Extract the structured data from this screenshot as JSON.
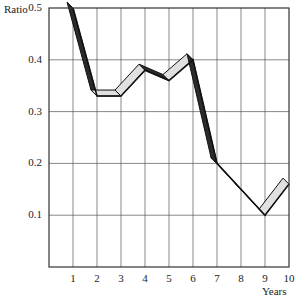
{
  "chart_data": {
    "type": "line",
    "style": "3d-ribbon",
    "title": "",
    "xlabel": "Years",
    "ylabel": "Ratio",
    "x": [
      1,
      2,
      3,
      4,
      5,
      6,
      7,
      8,
      9,
      10
    ],
    "x_tick_labels": [
      "1",
      "2",
      "3",
      "4",
      "5",
      "6",
      "7",
      "8",
      "9",
      "10"
    ],
    "y_tick_labels": [
      "0.1",
      "0.2",
      "0.3",
      "0.4",
      "0.5"
    ],
    "y_ticks": [
      0.1,
      0.2,
      0.3,
      0.4,
      0.5
    ],
    "ylim": [
      0,
      0.5
    ],
    "xlim": [
      0,
      10
    ],
    "grid": true,
    "legend": null,
    "series": [
      {
        "name": "Ratio",
        "values": [
          0.5,
          0.33,
          0.33,
          0.38,
          0.36,
          0.4,
          0.2,
          0.15,
          0.1,
          0.16
        ]
      }
    ],
    "colors": {
      "falling_face": "#2b2b2b",
      "rising_face": "#e0e0e0",
      "grid": "#555555",
      "axis": "#333333"
    }
  }
}
